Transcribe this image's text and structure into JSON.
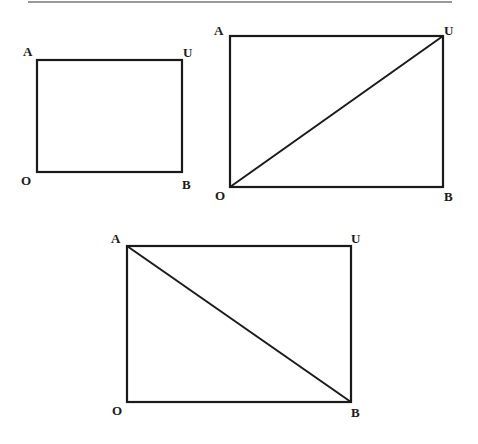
{
  "figures": [
    {
      "name": "rectangle-plain",
      "labels": {
        "top_left": "A",
        "top_right": "U",
        "bottom_left": "O",
        "bottom_right": "B"
      },
      "diagonal": null
    },
    {
      "name": "rectangle-diagonal-OU",
      "labels": {
        "top_left": "A",
        "top_right": "U",
        "bottom_left": "O",
        "bottom_right": "B"
      },
      "diagonal": "O-U"
    },
    {
      "name": "rectangle-diagonal-AB",
      "labels": {
        "top_left": "A",
        "top_right": "U",
        "bottom_left": "O",
        "bottom_right": "B"
      },
      "diagonal": "A-B"
    }
  ],
  "colors": {
    "stroke": "#1a1a1a",
    "rule": "#777777"
  }
}
